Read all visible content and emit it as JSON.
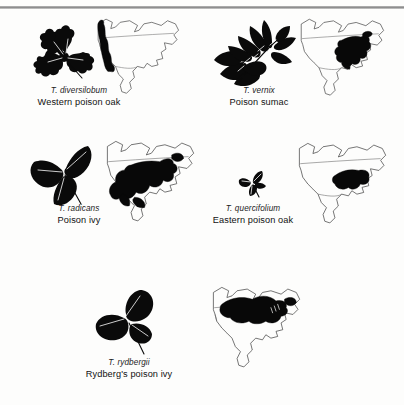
{
  "figure": {
    "background": "#fdfdfc",
    "ink": "#0a0a0a",
    "coastline_color": "#4a4a4a",
    "range_fill": "#080808",
    "top_rule": "horizontal-rule"
  },
  "entries": [
    {
      "id": "diversilobum",
      "scientific_name": "T. diversilobum",
      "common_name": "Western poison oak",
      "leaf_icon": "three-lobed-oak-leaflet-silhouette",
      "leaflet_count": 3,
      "leaf_description": "trifoliate, lobed oak-like leaflets",
      "map_icon": "north-america-range-map",
      "range_description": "narrow strip along the Pacific coast from British Columbia to Baja California",
      "range_region": "Pacific coast"
    },
    {
      "id": "vernix",
      "scientific_name": "T. vernix",
      "common_name": "Poison sumac",
      "leaf_icon": "pinnate-compound-leaf-silhouette",
      "leaflet_count": 9,
      "leaf_description": "pinnately compound with opposite lance-shaped leaflets and one terminal leaflet",
      "map_icon": "north-america-range-map",
      "range_description": "eastern United States from the Great Lakes and New England south to the Gulf coast",
      "range_region": "Eastern United States"
    },
    {
      "id": "radicans",
      "scientific_name": "T. radicans",
      "common_name": "Poison ivy",
      "leaf_icon": "three-pointed-leaflet-silhouette",
      "leaflet_count": 3,
      "leaf_description": "trifoliate with pointed ovate leaflets",
      "map_icon": "north-america-range-map",
      "range_description": "broad range covering the central, southern and eastern United States and much of Mexico",
      "range_region": "Central, southern and eastern North America"
    },
    {
      "id": "quercifolium",
      "scientific_name": "T. quercifolium",
      "common_name": "Eastern poison oak",
      "leaf_icon": "small-three-lobed-leaflet-silhouette",
      "leaflet_count": 3,
      "leaf_description": "small trifoliate leaf with lobed leaflets",
      "map_icon": "north-america-range-map",
      "range_description": "southeastern United States from Texas and Oklahoma east to the Atlantic coast",
      "range_region": "Southeastern United States"
    },
    {
      "id": "rydbergii",
      "scientific_name": "T. rydbergii",
      "common_name": "Rydberg's poison ivy",
      "leaf_icon": "three-rounded-leaflet-silhouette",
      "leaflet_count": 3,
      "leaf_description": "trifoliate with broad rounded leaflets",
      "map_icon": "north-america-range-map",
      "range_description": "northern United States and southern Canada across the plains to the northeast",
      "range_region": "Northern United States and southern Canada"
    }
  ]
}
